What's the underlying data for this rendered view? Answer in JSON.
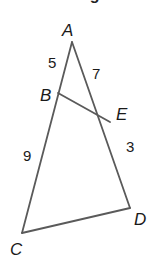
{
  "header": {
    "clipped_text": "Find the length of DE"
  },
  "diagram": {
    "vertices": [
      {
        "name": "A",
        "x": 72,
        "y": 42,
        "label_x": 62,
        "label_y": 36
      },
      {
        "name": "B",
        "x": 58,
        "y": 93,
        "label_x": 40,
        "label_y": 101
      },
      {
        "name": "E",
        "x": 110,
        "y": 122,
        "label_x": 116,
        "label_y": 120
      },
      {
        "name": "D",
        "x": 130,
        "y": 208,
        "label_x": 134,
        "label_y": 225
      },
      {
        "name": "C",
        "x": 22,
        "y": 233,
        "label_x": 10,
        "label_y": 255
      }
    ],
    "segments": [
      {
        "from": "A",
        "to": "C"
      },
      {
        "from": "A",
        "to": "D"
      },
      {
        "from": "C",
        "to": "D"
      },
      {
        "from": "B",
        "to": "E"
      }
    ],
    "measurements": [
      {
        "segment": "AB",
        "value": "5",
        "x": 48,
        "y": 68
      },
      {
        "segment": "AE",
        "value": "7",
        "x": 92,
        "y": 79
      },
      {
        "segment": "ED",
        "value": "3",
        "x": 126,
        "y": 152
      },
      {
        "segment": "BC",
        "value": "9",
        "x": 23,
        "y": 161
      }
    ],
    "stroke_color": "#5a5a5a"
  }
}
